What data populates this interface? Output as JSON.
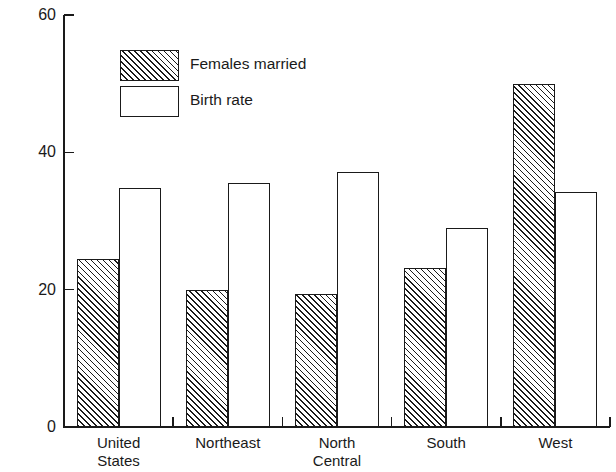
{
  "chart_data": {
    "type": "bar",
    "title": "",
    "xlabel": "",
    "ylabel": "Per Cent Increase",
    "ylim": [
      0,
      60
    ],
    "yticks": [
      0,
      20,
      40,
      60
    ],
    "grid": false,
    "legend_position": "upper-left-inside",
    "categories": [
      "United\nStates",
      "Northeast",
      "North\nCentral",
      "South",
      "West"
    ],
    "series": [
      {
        "name": "Females married",
        "style": "hatched",
        "values": [
          24.4,
          20.0,
          19.4,
          23.1,
          50.0
        ]
      },
      {
        "name": "Birth rate",
        "style": "white",
        "values": [
          34.8,
          35.6,
          37.1,
          29.0,
          34.2
        ]
      }
    ]
  },
  "axis": {
    "y_title": "Per Cent Increase",
    "y_tick_labels": [
      "60",
      "40",
      "20",
      "0"
    ]
  },
  "legend": {
    "items": [
      {
        "label": "Females married",
        "style": "hatched"
      },
      {
        "label": "Birth rate",
        "style": "white"
      }
    ]
  },
  "colors": {
    "ink": "#1a1a1a",
    "background": "#ffffff"
  }
}
